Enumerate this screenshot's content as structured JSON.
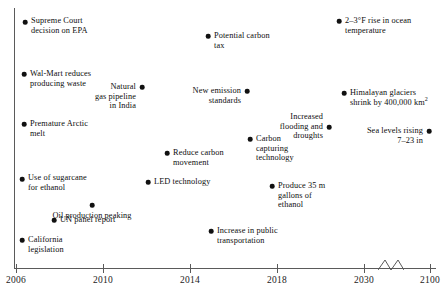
{
  "chart_data": {
    "type": "scatter",
    "title": "",
    "xlabel": "",
    "ylabel": "",
    "grid": false,
    "legend": null,
    "axis": {
      "break_between": [
        2030,
        2100
      ],
      "tick_labels": [
        "2006",
        "2010",
        "2014",
        "2018",
        "2030",
        "2100"
      ],
      "tick_x_px": [
        16,
        103,
        190,
        277,
        364,
        430
      ]
    },
    "events": [
      {
        "label": "Supreme Court\ndecision on EPA",
        "year": 2006,
        "dot_x": 25,
        "dot_y": 22,
        "label_x": 31,
        "label_y": 16,
        "align": "right"
      },
      {
        "label": "Wal-Mart reduces\nproducing waste",
        "year": 2006,
        "dot_x": 24,
        "dot_y": 74,
        "label_x": 30,
        "label_y": 69,
        "align": "right"
      },
      {
        "label": "Premature Arctic\nmelt",
        "year": 2006,
        "dot_x": 24,
        "dot_y": 124,
        "label_x": 30,
        "label_y": 119,
        "align": "right"
      },
      {
        "label": "Use of sugarcane\nfor ethanol",
        "year": 2006,
        "dot_x": 22,
        "dot_y": 179,
        "label_x": 28,
        "label_y": 173,
        "align": "right"
      },
      {
        "label": "UN panel report",
        "year": 2008,
        "dot_x": 54,
        "dot_y": 220,
        "label_x": 60,
        "label_y": 215,
        "align": "right"
      },
      {
        "label": "California\nlegislation",
        "year": 2006,
        "dot_x": 22,
        "dot_y": 240,
        "label_x": 28,
        "label_y": 235,
        "align": "right"
      },
      {
        "label": "Oil production peaking",
        "year": 2009,
        "dot_x": 92,
        "dot_y": 205,
        "label_x": 92,
        "label_y": 211,
        "align": "center"
      },
      {
        "label": "Natural\ngas pipeline\nin India",
        "year": 2012,
        "dot_x": 142,
        "dot_y": 87,
        "label_x": 136,
        "label_y": 82,
        "align": "left"
      },
      {
        "label": "LED technology",
        "year": 2013,
        "dot_x": 148,
        "dot_y": 182,
        "label_x": 154,
        "label_y": 177,
        "align": "right"
      },
      {
        "label": "Reduce carbon\nmovement",
        "year": 2015,
        "dot_x": 167,
        "dot_y": 153,
        "label_x": 173,
        "label_y": 148,
        "align": "right"
      },
      {
        "label": "Increase in public\ntransportation",
        "year": 2018,
        "dot_x": 211,
        "dot_y": 231,
        "label_x": 217,
        "label_y": 226,
        "align": "right"
      },
      {
        "label": "Potential carbon\ntax",
        "year": 2018,
        "dot_x": 208,
        "dot_y": 36,
        "label_x": 214,
        "label_y": 31,
        "align": "right"
      },
      {
        "label": "New emission\nstandards",
        "year": 2020,
        "dot_x": 247,
        "dot_y": 91,
        "label_x": 241,
        "label_y": 86,
        "align": "left"
      },
      {
        "label": "Carbon\ncapturing\ntechnology",
        "year": 2020,
        "dot_x": 250,
        "dot_y": 139,
        "label_x": 256,
        "label_y": 134,
        "align": "right"
      },
      {
        "label": "Produce 35 m\ngallons of\nethanol",
        "year": 2023,
        "dot_x": 272,
        "dot_y": 186,
        "label_x": 278,
        "label_y": 181,
        "align": "right"
      },
      {
        "label": "Increased\nflooding and\ndroughts",
        "year": 2026,
        "dot_x": 329,
        "dot_y": 127,
        "label_x": 323,
        "label_y": 112,
        "align": "left"
      },
      {
        "label": "2–3°F rise in ocean\ntemperature",
        "year": 2030,
        "dot_x": 339,
        "dot_y": 21,
        "label_x": 345,
        "label_y": 16,
        "align": "right"
      },
      {
        "label": "Himalayan glaciers\nshrink by 400,000 km",
        "label_superscript": "2",
        "year": 2034,
        "dot_x": 344,
        "dot_y": 93,
        "label_x": 350,
        "label_y": 88,
        "align": "right"
      },
      {
        "label": "Sea levels rising\n7–23 in",
        "year": 2100,
        "dot_x": 429,
        "dot_y": 131,
        "label_x": 423,
        "label_y": 126,
        "align": "left"
      }
    ]
  }
}
